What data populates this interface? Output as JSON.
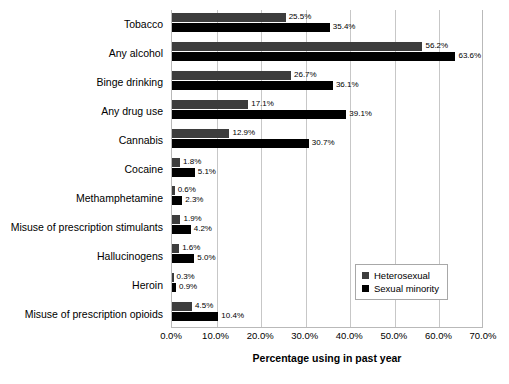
{
  "chart_data": {
    "type": "bar",
    "orientation": "horizontal",
    "title": "",
    "xlabel": "Percentage using in past year",
    "ylabel": "",
    "xlim": [
      0,
      70
    ],
    "xtick_labels": [
      "0.0%",
      "10.0%",
      "20.0%",
      "30.0%",
      "40.0%",
      "50.0%",
      "60.0%",
      "70.0%"
    ],
    "xtick_values": [
      0,
      10,
      20,
      30,
      40,
      50,
      60,
      70
    ],
    "grid": true,
    "grid_axis": "x",
    "legend_position": "lower right",
    "categories": [
      "Tobacco",
      "Any alcohol",
      "Binge drinking",
      "Any drug use",
      "Cannabis",
      "Cocaine",
      "Methamphetamine",
      "Misuse of prescription stimulants",
      "Hallucinogens",
      "Heroin",
      "Misuse of prescription opioids"
    ],
    "series": [
      {
        "name": "Heterosexual",
        "color": "#3d3d3d",
        "values": [
          25.5,
          56.2,
          26.7,
          17.1,
          12.9,
          1.8,
          0.6,
          1.9,
          1.6,
          0.3,
          4.5
        ],
        "labels": [
          "25.5%",
          "56.2%",
          "26.7%",
          "17.1%",
          "12.9%",
          "1.8%",
          "0.6%",
          "1.9%",
          "1.6%",
          "0.3%",
          "4.5%"
        ]
      },
      {
        "name": "Sexual minority",
        "color": "#000000",
        "values": [
          35.4,
          63.6,
          36.1,
          39.1,
          30.7,
          5.1,
          2.3,
          4.2,
          5.0,
          0.9,
          10.4
        ],
        "labels": [
          "35.4%",
          "63.6%",
          "36.1%",
          "39.1%",
          "30.7%",
          "5.1%",
          "2.3%",
          "4.2%",
          "5.0%",
          "0.9%",
          "10.4%"
        ]
      }
    ]
  }
}
